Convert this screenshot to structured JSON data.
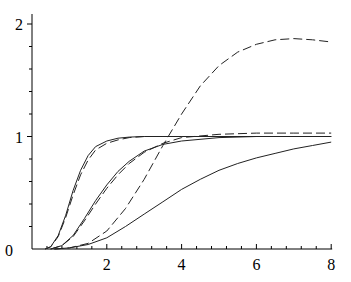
{
  "chart_data": {
    "type": "line",
    "title": "",
    "xlabel": "",
    "ylabel": "",
    "xlim": [
      0,
      8
    ],
    "ylim": [
      0,
      2.1
    ],
    "grid": false,
    "legend": null,
    "x_ticks": [
      2,
      4,
      6,
      8
    ],
    "x_tick_labels": [
      "2",
      "4",
      "6",
      "8"
    ],
    "y_ticks": [
      1,
      2
    ],
    "y_tick_labels": [
      "1",
      "2"
    ],
    "origin_label": "0",
    "series": [
      {
        "name": "curve-1-solid",
        "style": "solid",
        "x": [
          0.35,
          0.5,
          0.7,
          0.9,
          1.1,
          1.3,
          1.5,
          1.7,
          2.0,
          2.3,
          2.6,
          3.0,
          3.5,
          4,
          5,
          6,
          7,
          8
        ],
        "y": [
          0,
          0.02,
          0.12,
          0.3,
          0.52,
          0.7,
          0.83,
          0.91,
          0.96,
          0.985,
          0.995,
          1.0,
          1.0,
          1.0,
          1.0,
          1.0,
          1.0,
          1.0
        ]
      },
      {
        "name": "curve-1-dashed",
        "style": "dashed",
        "x": [
          0.35,
          0.5,
          0.7,
          0.9,
          1.1,
          1.3,
          1.5,
          1.7,
          2.0,
          2.3,
          2.6,
          3.0,
          3.5,
          4,
          5,
          6,
          7,
          8
        ],
        "y": [
          0,
          0.02,
          0.11,
          0.28,
          0.48,
          0.66,
          0.79,
          0.88,
          0.94,
          0.97,
          0.99,
          1.0,
          1.0,
          1.0,
          1.0,
          1.0,
          1.0,
          1.0
        ]
      },
      {
        "name": "curve-2-solid",
        "style": "solid",
        "x": [
          0.5,
          0.8,
          1.1,
          1.4,
          1.7,
          2.0,
          2.3,
          2.6,
          3.0,
          3.5,
          4,
          5,
          6,
          7,
          8
        ],
        "y": [
          0,
          0.03,
          0.12,
          0.27,
          0.43,
          0.57,
          0.69,
          0.78,
          0.87,
          0.93,
          0.96,
          0.99,
          1.0,
          1.0,
          1.0
        ]
      },
      {
        "name": "curve-2-dashed",
        "style": "dashed",
        "x": [
          0.5,
          0.8,
          1.1,
          1.4,
          1.7,
          2.0,
          2.3,
          2.6,
          3.0,
          3.5,
          4,
          5,
          6,
          7,
          8
        ],
        "y": [
          0,
          0.03,
          0.11,
          0.25,
          0.4,
          0.54,
          0.66,
          0.76,
          0.86,
          0.94,
          0.99,
          1.02,
          1.03,
          1.03,
          1.03
        ]
      },
      {
        "name": "curve-3-solid",
        "style": "solid",
        "x": [
          0.6,
          1.0,
          1.5,
          2.0,
          2.5,
          3.0,
          3.5,
          4.0,
          4.5,
          5.0,
          5.5,
          6.0,
          6.5,
          7.0,
          7.5,
          8.0
        ],
        "y": [
          0,
          0.01,
          0.04,
          0.1,
          0.2,
          0.31,
          0.42,
          0.53,
          0.62,
          0.7,
          0.76,
          0.81,
          0.85,
          0.89,
          0.92,
          0.95
        ]
      },
      {
        "name": "curve-3-dashed",
        "style": "dashed",
        "x": [
          0.6,
          1.0,
          1.5,
          2.0,
          2.5,
          3.0,
          3.5,
          4.0,
          4.5,
          5.0,
          5.5,
          6.0,
          6.5,
          7.0,
          7.5,
          8.0
        ],
        "y": [
          0,
          0.01,
          0.05,
          0.16,
          0.36,
          0.62,
          0.92,
          1.2,
          1.45,
          1.63,
          1.75,
          1.82,
          1.86,
          1.87,
          1.86,
          1.84
        ]
      }
    ]
  }
}
